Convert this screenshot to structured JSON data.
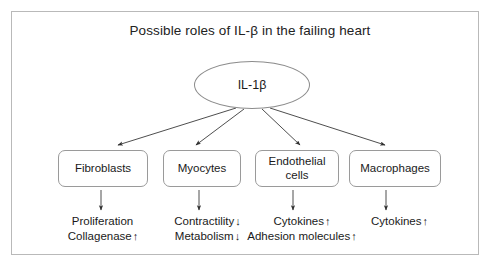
{
  "figure": {
    "title": "Possible roles of IL-β in the failing heart",
    "source_node": {
      "label": "IL-1β"
    },
    "targets": [
      {
        "box_label": "Fibroblasts",
        "effects": [
          {
            "text": "Proliferation",
            "arrow": ""
          },
          {
            "text": "Collagenase",
            "arrow": "↑"
          }
        ]
      },
      {
        "box_label": "Myocytes",
        "effects": [
          {
            "text": "Contractility",
            "arrow": "↓"
          },
          {
            "text": "Metabolism",
            "arrow": "↓"
          }
        ]
      },
      {
        "box_label": "Endothelial cells",
        "effects": [
          {
            "text": "Cytokines",
            "arrow": "↑"
          },
          {
            "text": "Adhesion molecules",
            "arrow": "↑"
          }
        ]
      },
      {
        "box_label": "Macrophages",
        "effects": [
          {
            "text": "Cytokines",
            "arrow": "↑"
          }
        ]
      }
    ]
  },
  "colors": {
    "frame_border": "#b9b9b9",
    "node_border": "#8c8c8c",
    "box_border": "#9a9a9a",
    "connector": "#3a3a3a",
    "text": "#1a1a1a",
    "background": "#ffffff"
  }
}
